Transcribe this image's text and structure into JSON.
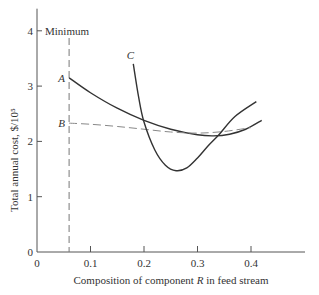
{
  "chart_data": {
    "type": "line",
    "title": "",
    "xlabel": "Composition of component R in feed stream",
    "ylabel": "Total annual cost, $/10^5",
    "xlabel_parts": {
      "pre": "Composition of component ",
      "var": "R",
      "post": " in feed stream"
    },
    "ylabel_text": "Total annual cost, $/10⁵",
    "xlim": [
      0,
      0.5
    ],
    "ylim": [
      0,
      4.4
    ],
    "x_ticks": [
      0,
      0.1,
      0.2,
      0.3,
      0.4
    ],
    "x_tick_labels": [
      "0",
      "0.1",
      "0.2",
      "0.3",
      "0.4"
    ],
    "y_ticks": [
      0,
      1,
      2,
      3,
      4
    ],
    "y_tick_labels": [
      "0",
      "1",
      "2",
      "3",
      "4"
    ],
    "grid": false,
    "annotations": [
      {
        "text": "Minimum",
        "x": 0.06,
        "y": 4,
        "note": "vertical dashed line at x=0.06 marking minimum feasible composition"
      }
    ],
    "series": [
      {
        "name": "A",
        "style": "solid",
        "x": [
          0.06,
          0.1,
          0.15,
          0.2,
          0.25,
          0.3,
          0.33,
          0.36,
          0.39,
          0.42
        ],
        "y": [
          3.15,
          2.88,
          2.6,
          2.38,
          2.22,
          2.12,
          2.1,
          2.13,
          2.22,
          2.38
        ]
      },
      {
        "name": "B",
        "style": "dashed",
        "x": [
          0.06,
          0.1,
          0.15,
          0.2,
          0.25,
          0.3,
          0.35,
          0.4
        ],
        "y": [
          2.33,
          2.31,
          2.27,
          2.22,
          2.17,
          2.15,
          2.18,
          2.25
        ]
      },
      {
        "name": "C",
        "style": "solid",
        "x": [
          0.18,
          0.19,
          0.2,
          0.22,
          0.24,
          0.26,
          0.28,
          0.3,
          0.32,
          0.34,
          0.37,
          0.41
        ],
        "y": [
          3.4,
          2.8,
          2.35,
          1.85,
          1.57,
          1.47,
          1.52,
          1.7,
          1.92,
          2.12,
          2.45,
          2.72
        ]
      }
    ],
    "minimum_line_x": 0.06
  }
}
